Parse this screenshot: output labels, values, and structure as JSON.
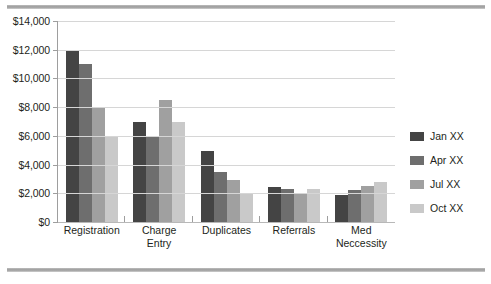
{
  "chart_data": {
    "type": "bar",
    "title": "",
    "subtitle": "",
    "xlabel": "",
    "ylabel": "",
    "ylim": [
      0,
      14000
    ],
    "ytick_step": 2000,
    "ytick_labels": [
      "$0",
      "$2,000",
      "$4,000",
      "$6,000",
      "$8,000",
      "$10,000",
      "$12,000",
      "$14,000"
    ],
    "ytick_values": [
      0,
      2000,
      4000,
      6000,
      8000,
      10000,
      12000,
      14000
    ],
    "grid": true,
    "legend_position": "right",
    "categories": [
      "Registration",
      "Charge Entry",
      "Duplicates",
      "Referrals",
      "Med Neccessity"
    ],
    "category_lines": [
      [
        "Registration"
      ],
      [
        "Charge",
        "Entry"
      ],
      [
        "Duplicates"
      ],
      [
        "Referrals"
      ],
      [
        "Med",
        "Neccessity"
      ]
    ],
    "series": [
      {
        "name": "Jan XX",
        "color": "#444444",
        "values": [
          12000,
          6950,
          4950,
          2450,
          1900
        ]
      },
      {
        "name": "Apr XX",
        "color": "#6e6e6e",
        "values": [
          11000,
          5980,
          3480,
          2330,
          2200
        ]
      },
      {
        "name": "Jul XX",
        "color": "#a0a0a0",
        "values": [
          7980,
          8520,
          2950,
          2020,
          2500
        ]
      },
      {
        "name": "Oct XX",
        "color": "#c9c9c9",
        "values": [
          5980,
          7000,
          1950,
          2300,
          2780
        ]
      }
    ]
  },
  "decor": {
    "rule_color": "#9a9a9a"
  }
}
